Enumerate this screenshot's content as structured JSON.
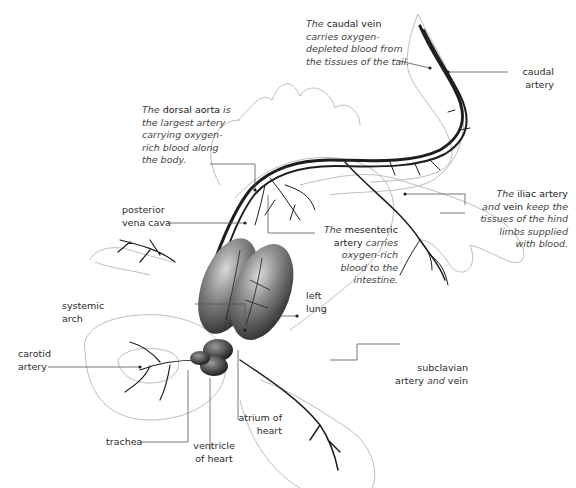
{
  "diagram": {
    "colors": {
      "outline": "#b8b8b8",
      "vessel": "#1e1e1e",
      "organ": "#4a4a4a",
      "leader": "#555555",
      "text": "#2b2b2b"
    }
  },
  "labels": {
    "caudal_vein": {
      "prefix": "The",
      "term": "caudal vein",
      "l1": "carries oxygen-",
      "l2": "depleted blood from",
      "l3": "the tissues of the tail."
    },
    "caudal_artery": {
      "l1": "caudal",
      "l2": "artery"
    },
    "dorsal_aorta": {
      "prefix": "The",
      "term": "dorsal aorta",
      "suffix": "is",
      "l1": "the largest artery",
      "l2": "carrying oxygen-",
      "l3": "rich blood along",
      "l4": "the body."
    },
    "posterior_vena_cava": {
      "l1": "posterior",
      "l2": "vena cava"
    },
    "iliac": {
      "prefix": "The",
      "term": "iliac artery",
      "and": "and",
      "term2": "vein",
      "suffix": "keep the",
      "l1": "tissues of the hind",
      "l2": "limbs supplied",
      "l3": "with blood."
    },
    "mesenteric": {
      "prefix": "The",
      "term": "mesenteric",
      "term2": "artery",
      "suffix": "carries",
      "l1": "oxygen-rich",
      "l2": "blood to the",
      "l3": "intestine."
    },
    "left_lung": {
      "l1": "left",
      "l2": "lung"
    },
    "systemic_arch": {
      "l1": "systemic",
      "l2": "arch"
    },
    "carotid_artery": {
      "l1": "carotid",
      "l2": "artery"
    },
    "subclavian": {
      "l1": "subclavian",
      "term": "artery",
      "and": "and",
      "term2": "vein"
    },
    "trachea": {
      "l1": "trachea"
    },
    "ventricle": {
      "l1": "ventricle",
      "l2": "of heart"
    },
    "atrium": {
      "l1": "atrium of",
      "l2": "heart"
    }
  }
}
